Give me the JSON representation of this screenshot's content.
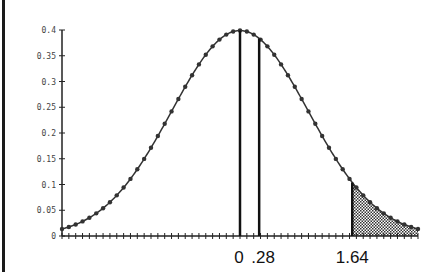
{
  "chart_data": {
    "type": "line",
    "title": "",
    "xlabel": "",
    "ylabel": "",
    "xlim": [
      -2.6,
      2.6
    ],
    "ylim": [
      0,
      0.4
    ],
    "yticks": [
      0,
      0.05,
      0.1,
      0.15,
      0.2,
      0.25,
      0.3,
      0.35,
      0.4
    ],
    "ytick_labels": [
      "0",
      "0.05",
      "0.1",
      "0.15",
      "0.2",
      "0.25",
      "0.3",
      "0.35",
      "0.4"
    ],
    "x_annotations": [
      {
        "x": 0,
        "label": "0"
      },
      {
        "x": 0.28,
        "label": ".28"
      },
      {
        "x": 1.64,
        "label": "1.64"
      }
    ],
    "vertical_lines": [
      0,
      0.28,
      1.64
    ],
    "shaded_region": {
      "from": 1.64,
      "to": 2.6,
      "pattern": "dotted"
    },
    "series": [
      {
        "name": "normal pdf",
        "mean": 0,
        "sd": 1,
        "marker": "dot",
        "point_step": 0.1
      }
    ],
    "grid": false,
    "legend": null
  }
}
